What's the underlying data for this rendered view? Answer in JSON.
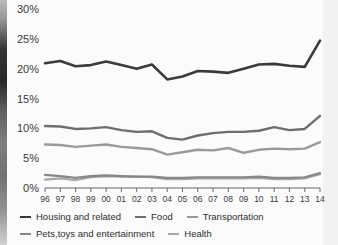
{
  "chart_data": {
    "type": "line",
    "title": "",
    "subtitle": "",
    "xlabel": "",
    "ylabel": "",
    "x": [
      "96",
      "97",
      "98",
      "99",
      "00",
      "01",
      "02",
      "03",
      "04",
      "05",
      "06",
      "07",
      "08",
      "09",
      "10",
      "11",
      "12",
      "13",
      "14"
    ],
    "xtick_labels": [
      "96",
      "97",
      "98",
      "99",
      "00",
      "01",
      "02",
      "03",
      "04",
      "05",
      "06",
      "07",
      "08",
      "09",
      "10",
      "11",
      "12",
      "13",
      "14"
    ],
    "ytick_labels": [
      "0%",
      "5%",
      "10%",
      "15%",
      "20%",
      "25%",
      "30%"
    ],
    "ytick_values": [
      0,
      5,
      10,
      15,
      20,
      25,
      30
    ],
    "ylim": [
      0,
      30
    ],
    "grid": false,
    "legend_position": "bottom",
    "series": [
      {
        "name": "Housing and related",
        "color": "#3a3a3a",
        "width": 2.6,
        "values": [
          20.9,
          21.3,
          20.4,
          20.6,
          21.2,
          20.6,
          20.0,
          20.7,
          18.2,
          18.7,
          19.6,
          19.5,
          19.3,
          20.0,
          20.7,
          20.8,
          20.5,
          20.3,
          24.7
        ]
      },
      {
        "name": "Food",
        "color": "#6e6e6e",
        "width": 2.4,
        "values": [
          10.4,
          10.3,
          9.9,
          10.0,
          10.2,
          9.7,
          9.4,
          9.5,
          8.4,
          8.1,
          8.8,
          9.2,
          9.4,
          9.4,
          9.6,
          10.2,
          9.7,
          9.9,
          12.1
        ]
      },
      {
        "name": "Transportation",
        "color": "#9a9a9a",
        "width": 2.4,
        "values": [
          7.3,
          7.2,
          6.9,
          7.1,
          7.3,
          6.9,
          6.7,
          6.5,
          5.6,
          6.0,
          6.4,
          6.3,
          6.7,
          5.9,
          6.4,
          6.6,
          6.5,
          6.6,
          7.7
        ]
      },
      {
        "name": "Pets,toys and entertainment",
        "color": "#878787",
        "width": 2.2,
        "values": [
          2.2,
          2.0,
          1.7,
          2.0,
          2.1,
          2.0,
          1.9,
          1.9,
          1.7,
          1.7,
          1.8,
          1.8,
          1.8,
          1.8,
          1.9,
          1.7,
          1.7,
          1.8,
          2.5
        ]
      },
      {
        "name": "Health",
        "color": "#a8a8a8",
        "width": 2.2,
        "values": [
          1.4,
          1.6,
          1.3,
          1.8,
          2.0,
          1.9,
          1.9,
          1.8,
          1.5,
          1.5,
          1.6,
          1.6,
          1.6,
          1.6,
          1.7,
          1.5,
          1.5,
          1.6,
          2.3
        ]
      }
    ]
  },
  "legend": {
    "row1": [
      {
        "label": "Housing and related",
        "color": "#3a3a3a"
      },
      {
        "label": "Food",
        "color": "#6e6e6e"
      },
      {
        "label": "Transportation",
        "color": "#9a9a9a"
      }
    ],
    "row2": [
      {
        "label": "Pets,toys and entertainment",
        "color": "#878787"
      },
      {
        "label": "Health",
        "color": "#a8a8a8"
      }
    ]
  },
  "axis": {
    "y_labels": [
      "30%",
      "25%",
      "20%",
      "15%",
      "10%",
      "5%",
      "0%"
    ],
    "x_labels": [
      "96",
      "97",
      "98",
      "99",
      "00",
      "01",
      "02",
      "03",
      "04",
      "05",
      "06",
      "07",
      "08",
      "09",
      "10",
      "11",
      "12",
      "13",
      "14"
    ]
  },
  "colors": {
    "axis_line": "#6b6b6b",
    "text": "#3a3a3a",
    "background": "#fbfbfb"
  }
}
